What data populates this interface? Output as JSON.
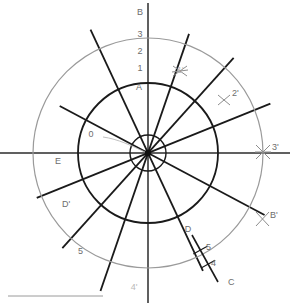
{
  "figure": {
    "background_color": "#ffffff",
    "width": 290,
    "height": 303
  },
  "colors": {
    "line_dark": "#1a1a1a",
    "circle_dark": "#1a1a1a",
    "circle_gray": "#9a9a9a",
    "label_gray": "#6d6d6d",
    "label_faint": "#b9b9b9",
    "axis": "#2b2b2b",
    "leader": "#b0b0b0",
    "scalebar": "#8f8f8f"
  },
  "geometry": {
    "center_x": 148,
    "center_y": 153,
    "inner_circle_radius": 18,
    "middle_circle_radius": 70,
    "outer_circle_radius": 115
  },
  "labels": {
    "axis_top": "B",
    "axis_tick_3": "3",
    "axis_tick_2": "2",
    "axis_tick_1": "1",
    "axis_point_a": "A",
    "axis_bottom": "4'",
    "origin": "0",
    "mark_1p": "1'",
    "mark_2p": "2'",
    "mark_3p": "3'",
    "mark_bp": "B'",
    "mark_dp": "D'",
    "mark_e": "E",
    "mark_5_left": "5",
    "seg_d": "D",
    "seg_c": "C",
    "seg_tick_5": "5",
    "seg_tick_4": "4"
  },
  "chart_data": {
    "type": "scatter",
    "xlabel": "",
    "ylabel": "",
    "grid": false,
    "legend": null,
    "circles": [
      {
        "name": "inner-hub-circle",
        "cx": 148,
        "cy": 153,
        "r": 18,
        "color": "#1a1a1a",
        "stroke_width": 1.4
      },
      {
        "name": "middle-circle",
        "cx": 148,
        "cy": 153,
        "r": 70,
        "color": "#1a1a1a",
        "stroke_width": 1.8
      },
      {
        "name": "outer-circle",
        "cx": 148,
        "cy": 153,
        "r": 115,
        "color": "#9a9a9a",
        "stroke_width": 1.2
      }
    ],
    "radial_lines": [
      {
        "name": "horizontal-axis",
        "angle_deg": 0,
        "t_neg": 152,
        "t_pos": 142,
        "color": "#2b2b2b",
        "stroke_width": 1.5
      },
      {
        "name": "vertical-axis",
        "angle_deg": 90,
        "t_neg": 150,
        "t_pos": 150,
        "color": "#2b2b2b",
        "stroke_width": 1.5
      },
      {
        "name": "radial-line-1",
        "angle_deg": 22,
        "t_neg": 120,
        "t_pos": 132,
        "color": "#1a1a1a",
        "stroke_width": 1.8
      },
      {
        "name": "radial-line-2",
        "angle_deg": 48,
        "t_neg": 128,
        "t_pos": 128,
        "color": "#1a1a1a",
        "stroke_width": 1.8
      },
      {
        "name": "radial-line-3",
        "angle_deg": 71,
        "t_neg": 146,
        "t_pos": 126,
        "color": "#1a1a1a",
        "stroke_width": 1.8
      },
      {
        "name": "radial-line-4",
        "angle_deg": 115,
        "t_neg": 130,
        "t_pos": 136,
        "color": "#1a1a1a",
        "stroke_width": 1.8
      },
      {
        "name": "radial-line-5",
        "angle_deg": 152,
        "t_neg": 132,
        "t_pos": 100,
        "color": "#1a1a1a",
        "stroke_width": 1.8
      }
    ],
    "cross_marks": [
      {
        "name": "cross-1p",
        "x": 180,
        "y": 71,
        "label": "1'"
      },
      {
        "name": "cross-2p",
        "x": 224,
        "y": 100,
        "label": "2'"
      },
      {
        "name": "cross-3p",
        "x": 263,
        "y": 152,
        "label": "3'"
      },
      {
        "name": "cross-bp",
        "x": 262,
        "y": 219,
        "label": "B'"
      }
    ],
    "segment_dc": {
      "name": "segment-d-c",
      "x1": 192,
      "y1": 235,
      "x2": 218,
      "y2": 282,
      "label_start": "D",
      "label_end": "C",
      "ticks": [
        {
          "label": "5",
          "pos": 0.32
        },
        {
          "label": "4",
          "pos": 0.62
        }
      ]
    },
    "axis_ticks": [
      {
        "label": "B",
        "x": 140,
        "y": 14
      },
      {
        "label": "3",
        "x": 140,
        "y": 36
      },
      {
        "label": "2",
        "x": 140,
        "y": 52
      },
      {
        "label": "1",
        "x": 140,
        "y": 70
      },
      {
        "label": "A",
        "x": 139,
        "y": 88
      },
      {
        "label": "4'",
        "x": 134,
        "y": 287
      }
    ],
    "annotations": [
      {
        "label": "0",
        "x": 95,
        "y": 135,
        "note": "origin callout with leader line to center"
      },
      {
        "label": "E",
        "x": 58,
        "y": 161,
        "note": "outer arc label, left"
      },
      {
        "label": "D'",
        "x": 66,
        "y": 203,
        "note": "intersection label, lower left"
      },
      {
        "label": "5",
        "x": 82,
        "y": 250,
        "note": "outer arc intersection, lower left"
      }
    ]
  }
}
